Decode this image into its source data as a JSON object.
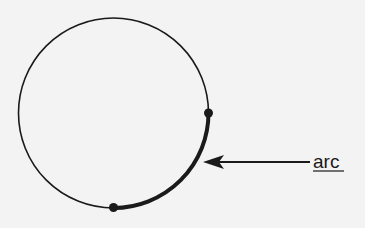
{
  "diagram": {
    "type": "circle-arc-illustration",
    "circle": {
      "cx": 113.5,
      "cy": 113,
      "r": 95,
      "stroke": "#1a1a1a"
    },
    "points": [
      {
        "name": "arc-start-point",
        "x": 209,
        "y": 113
      },
      {
        "name": "arc-end-point",
        "x": 113,
        "y": 207
      }
    ],
    "arc": {
      "from_point": 0,
      "to_point": 1,
      "emphasis": "thick"
    },
    "annotation": {
      "label": "arc",
      "underlined": true,
      "arrow": {
        "from": [
          310,
          162
        ],
        "to": [
          203,
          162
        ]
      }
    },
    "colors": {
      "background": "#f3f3f3",
      "ink": "#1a1a1a"
    }
  }
}
